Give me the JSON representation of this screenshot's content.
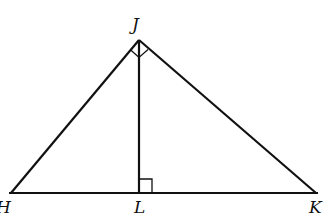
{
  "diagram": {
    "type": "right-triangle-with-altitude",
    "points": {
      "J": {
        "label": "J",
        "x": 139,
        "y": 40
      },
      "H": {
        "label": "H",
        "x": 11,
        "y": 193
      },
      "L": {
        "label": "L",
        "x": 139,
        "y": 193
      },
      "K": {
        "label": "K",
        "x": 316,
        "y": 193
      }
    },
    "segments": [
      "HJ",
      "JK",
      "HK",
      "JL"
    ],
    "right_angles": [
      "HJK",
      "JLK"
    ],
    "colors": {
      "stroke": "#111111",
      "background": "#ffffff"
    }
  }
}
